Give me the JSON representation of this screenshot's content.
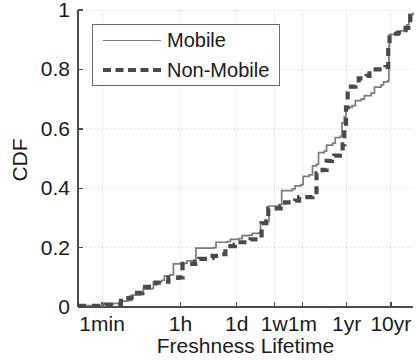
{
  "chart_data": {
    "type": "line",
    "title": "",
    "xlabel": "Freshness Lifetime",
    "ylabel": "CDF",
    "grid": true,
    "legend_position": "upper-left",
    "ylim": [
      0,
      1
    ],
    "ytick_labels": [
      "0",
      "0.2",
      "0.4",
      "0.6",
      "0.8",
      "1"
    ],
    "ytick_values": [
      0,
      0.2,
      0.4,
      0.6,
      0.8,
      1
    ],
    "xtick_labels": [
      "1min",
      "1h",
      "1d",
      "1w",
      "1m",
      "1yr",
      "10yr"
    ],
    "xtick_seconds": [
      60,
      3600,
      86400,
      604800,
      2592000,
      31536000,
      315360000
    ],
    "x_scale": "log",
    "series": [
      {
        "name": "Mobile",
        "style": "solid",
        "color": "#7d7d7d",
        "points": [
          [
            0.0,
            0.005
          ],
          [
            0.055,
            0.005
          ],
          [
            0.075,
            0.01
          ],
          [
            0.105,
            0.012
          ],
          [
            0.125,
            0.02
          ],
          [
            0.15,
            0.022
          ],
          [
            0.16,
            0.04
          ],
          [
            0.185,
            0.042
          ],
          [
            0.195,
            0.06
          ],
          [
            0.215,
            0.062
          ],
          [
            0.225,
            0.085
          ],
          [
            0.25,
            0.09
          ],
          [
            0.258,
            0.105
          ],
          [
            0.275,
            0.108
          ],
          [
            0.285,
            0.145
          ],
          [
            0.318,
            0.148
          ],
          [
            0.325,
            0.155
          ],
          [
            0.345,
            0.158
          ],
          [
            0.352,
            0.198
          ],
          [
            0.405,
            0.2
          ],
          [
            0.412,
            0.218
          ],
          [
            0.445,
            0.22
          ],
          [
            0.455,
            0.228
          ],
          [
            0.48,
            0.23
          ],
          [
            0.49,
            0.24
          ],
          [
            0.512,
            0.242
          ],
          [
            0.52,
            0.248
          ],
          [
            0.54,
            0.25
          ],
          [
            0.545,
            0.285
          ],
          [
            0.565,
            0.288
          ],
          [
            0.57,
            0.34
          ],
          [
            0.6,
            0.345
          ],
          [
            0.608,
            0.392
          ],
          [
            0.64,
            0.398
          ],
          [
            0.648,
            0.408
          ],
          [
            0.665,
            0.412
          ],
          [
            0.672,
            0.44
          ],
          [
            0.69,
            0.445
          ],
          [
            0.7,
            0.475
          ],
          [
            0.712,
            0.48
          ],
          [
            0.718,
            0.52
          ],
          [
            0.735,
            0.525
          ],
          [
            0.742,
            0.545
          ],
          [
            0.76,
            0.552
          ],
          [
            0.768,
            0.57
          ],
          [
            0.783,
            0.575
          ],
          [
            0.788,
            0.62
          ],
          [
            0.795,
            0.64
          ],
          [
            0.8,
            0.672
          ],
          [
            0.818,
            0.678
          ],
          [
            0.828,
            0.695
          ],
          [
            0.845,
            0.7
          ],
          [
            0.855,
            0.712
          ],
          [
            0.875,
            0.72
          ],
          [
            0.885,
            0.74
          ],
          [
            0.905,
            0.748
          ],
          [
            0.912,
            0.758
          ],
          [
            0.925,
            0.762
          ],
          [
            0.928,
            0.88
          ],
          [
            0.93,
            0.918
          ],
          [
            0.952,
            0.922
          ],
          [
            0.962,
            0.93
          ],
          [
            0.975,
            0.938
          ],
          [
            0.982,
            0.95
          ],
          [
            0.988,
            0.985
          ],
          [
            1.0,
            0.992
          ]
        ]
      },
      {
        "name": "Non-Mobile",
        "style": "dashed",
        "color": "#4a4a4a",
        "points": [
          [
            0.0,
            0.004
          ],
          [
            0.06,
            0.004
          ],
          [
            0.082,
            0.008
          ],
          [
            0.112,
            0.01
          ],
          [
            0.128,
            0.03
          ],
          [
            0.158,
            0.032
          ],
          [
            0.168,
            0.048
          ],
          [
            0.192,
            0.052
          ],
          [
            0.2,
            0.068
          ],
          [
            0.222,
            0.07
          ],
          [
            0.232,
            0.082
          ],
          [
            0.262,
            0.085
          ],
          [
            0.27,
            0.098
          ],
          [
            0.3,
            0.1
          ],
          [
            0.312,
            0.145
          ],
          [
            0.35,
            0.15
          ],
          [
            0.362,
            0.162
          ],
          [
            0.392,
            0.165
          ],
          [
            0.402,
            0.172
          ],
          [
            0.43,
            0.178
          ],
          [
            0.44,
            0.205
          ],
          [
            0.468,
            0.21
          ],
          [
            0.478,
            0.218
          ],
          [
            0.505,
            0.222
          ],
          [
            0.515,
            0.228
          ],
          [
            0.538,
            0.232
          ],
          [
            0.548,
            0.282
          ],
          [
            0.562,
            0.288
          ],
          [
            0.568,
            0.332
          ],
          [
            0.605,
            0.338
          ],
          [
            0.618,
            0.352
          ],
          [
            0.648,
            0.358
          ],
          [
            0.66,
            0.37
          ],
          [
            0.7,
            0.375
          ],
          [
            0.712,
            0.45
          ],
          [
            0.73,
            0.462
          ],
          [
            0.742,
            0.492
          ],
          [
            0.758,
            0.498
          ],
          [
            0.765,
            0.51
          ],
          [
            0.782,
            0.518
          ],
          [
            0.79,
            0.548
          ],
          [
            0.795,
            0.6
          ],
          [
            0.8,
            0.672
          ],
          [
            0.805,
            0.742
          ],
          [
            0.828,
            0.748
          ],
          [
            0.838,
            0.77
          ],
          [
            0.862,
            0.778
          ],
          [
            0.87,
            0.8
          ],
          [
            0.908,
            0.805
          ],
          [
            0.918,
            0.808
          ],
          [
            0.926,
            0.88
          ],
          [
            0.93,
            0.92
          ],
          [
            0.955,
            0.924
          ],
          [
            0.968,
            0.932
          ],
          [
            0.978,
            0.94
          ],
          [
            0.986,
            0.952
          ],
          [
            0.992,
            0.988
          ],
          [
            1.0,
            0.995
          ]
        ]
      }
    ]
  },
  "axes": {
    "ylabel": "CDF",
    "xlabel": "Freshness Lifetime",
    "yticks": [
      {
        "label": "0",
        "value": 0
      },
      {
        "label": "0.2",
        "value": 0.2
      },
      {
        "label": "0.4",
        "value": 0.4
      },
      {
        "label": "0.6",
        "value": 0.6
      },
      {
        "label": "0.8",
        "value": 0.8
      },
      {
        "label": "1",
        "value": 1
      }
    ],
    "xticks": [
      {
        "label": "1min",
        "pos": 0.072
      },
      {
        "label": "1h",
        "pos": 0.306
      },
      {
        "label": "1d",
        "pos": 0.474
      },
      {
        "label": "1w",
        "pos": 0.586
      },
      {
        "label": "1m",
        "pos": 0.67
      },
      {
        "label": "1yr",
        "pos": 0.802
      },
      {
        "label": "10yr",
        "pos": 0.934
      }
    ]
  },
  "legend": {
    "entries": [
      {
        "label": "Mobile",
        "style": "solid",
        "color": "#7d7d7d"
      },
      {
        "label": "Non-Mobile",
        "style": "dashed",
        "color": "#4a4a4a"
      }
    ]
  },
  "colors": {
    "axis": "#4d4d4d",
    "grid": "#cfcfcf",
    "mobile": "#7d7d7d",
    "non_mobile": "#4a4a4a",
    "text": "#1a1a1a",
    "background": "#ffffff"
  }
}
